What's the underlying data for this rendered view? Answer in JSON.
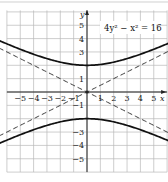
{
  "chart_data": {
    "type": "line",
    "title": "",
    "equation_label": "4y² − x² = 16",
    "xlabel": "x",
    "ylabel": "y",
    "xlim": [
      -6,
      6
    ],
    "ylim": [
      -6,
      6
    ],
    "grid": true,
    "x_ticks": [
      -5,
      -4,
      -3,
      -2,
      -1,
      1,
      2,
      3,
      4,
      5
    ],
    "x_tick_labels": [
      "−5",
      "−4",
      "−3",
      "−2",
      "−1",
      "1",
      "2",
      "3",
      "4",
      "5"
    ],
    "y_ticks": [
      5,
      4,
      3,
      1,
      -1,
      -3,
      -4,
      -5
    ],
    "y_tick_labels": [
      "5",
      "4",
      "3",
      "1",
      "−1",
      "−3",
      "−4",
      "−5"
    ],
    "series": [
      {
        "name": "hyperbola upper branch",
        "style": "solid",
        "function": "y = sqrt(4 + x^2/4)",
        "vertex": [
          0,
          2
        ]
      },
      {
        "name": "hyperbola lower branch",
        "style": "solid",
        "function": "y = -sqrt(4 + x^2/4)",
        "vertex": [
          0,
          -2
        ]
      },
      {
        "name": "asymptote y = x/2",
        "style": "dashed",
        "slope": 0.5
      },
      {
        "name": "asymptote y = -x/2",
        "style": "dashed",
        "slope": -0.5
      }
    ]
  }
}
